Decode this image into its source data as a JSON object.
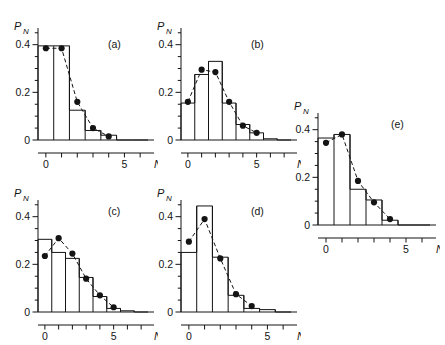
{
  "figure": {
    "axis_labels": {
      "y": "P",
      "y_sub": "N",
      "x": "N"
    },
    "y_ticks": [
      "0",
      "0.2",
      "0.4"
    ],
    "x_ticks": [
      "0",
      "5"
    ]
  },
  "chart_data": [
    {
      "type": "bar",
      "panel": "(a)",
      "title": "",
      "xlabel": "N",
      "ylabel": "P_N",
      "categories": [
        0,
        1,
        2,
        3,
        4,
        5,
        6
      ],
      "values": [
        0.395,
        0.395,
        0.125,
        0.04,
        0.02,
        0.0,
        0.0
      ],
      "series": [
        {
          "name": "data points",
          "x": [
            0,
            1,
            2,
            3,
            4
          ],
          "values": [
            0.385,
            0.385,
            0.16,
            0.05,
            0.015
          ]
        }
      ],
      "xlim": [
        -0.5,
        6.5
      ],
      "ylim": [
        0,
        0.47
      ],
      "grid": false,
      "legend": "none"
    },
    {
      "type": "bar",
      "panel": "(b)",
      "title": "",
      "xlabel": "N",
      "ylabel": "P_N",
      "categories": [
        0,
        1,
        2,
        3,
        4,
        5,
        6,
        7
      ],
      "values": [
        0.155,
        0.275,
        0.33,
        0.155,
        0.065,
        0.03,
        0.005,
        0.0
      ],
      "series": [
        {
          "name": "data points",
          "x": [
            0,
            1,
            2,
            3,
            4,
            5
          ],
          "values": [
            0.16,
            0.295,
            0.285,
            0.16,
            0.06,
            0.03
          ]
        }
      ],
      "xlim": [
        -0.5,
        7.5
      ],
      "ylim": [
        0,
        0.47
      ],
      "grid": false,
      "legend": "none"
    },
    {
      "type": "bar",
      "panel": "(c)",
      "title": "",
      "xlabel": "N",
      "ylabel": "P_N",
      "categories": [
        0,
        1,
        2,
        3,
        4,
        5,
        6,
        7
      ],
      "values": [
        0.305,
        0.25,
        0.225,
        0.145,
        0.065,
        0.015,
        0.005,
        0.0
      ],
      "series": [
        {
          "name": "data points",
          "x": [
            0,
            1,
            2,
            3,
            4,
            5
          ],
          "values": [
            0.235,
            0.31,
            0.245,
            0.14,
            0.07,
            0.02
          ]
        }
      ],
      "xlim": [
        -0.5,
        7.5
      ],
      "ylim": [
        0,
        0.47
      ],
      "grid": false,
      "legend": "none"
    },
    {
      "type": "bar",
      "panel": "(d)",
      "title": "",
      "xlabel": "N",
      "ylabel": "P_N",
      "categories": [
        0,
        1,
        2,
        3,
        4,
        5,
        6
      ],
      "values": [
        0.25,
        0.445,
        0.23,
        0.07,
        0.015,
        0.01,
        0.0
      ],
      "series": [
        {
          "name": "data points",
          "x": [
            0,
            1,
            2,
            3,
            4
          ],
          "values": [
            0.295,
            0.39,
            0.225,
            0.075,
            0.025
          ]
        }
      ],
      "xlim": [
        -0.5,
        6.5
      ],
      "ylim": [
        0,
        0.47
      ],
      "grid": false,
      "legend": "none"
    },
    {
      "type": "bar",
      "panel": "(e)",
      "title": "",
      "xlabel": "N",
      "ylabel": "P_N",
      "categories": [
        0,
        1,
        2,
        3,
        4,
        5,
        6
      ],
      "values": [
        0.365,
        0.38,
        0.15,
        0.105,
        0.02,
        0.0,
        0.0
      ],
      "series": [
        {
          "name": "data points",
          "x": [
            0,
            1,
            2,
            3,
            4
          ],
          "values": [
            0.345,
            0.38,
            0.185,
            0.095,
            0.025
          ]
        }
      ],
      "xlim": [
        -0.5,
        6.5
      ],
      "ylim": [
        0,
        0.47
      ],
      "grid": false,
      "legend": "none"
    }
  ]
}
